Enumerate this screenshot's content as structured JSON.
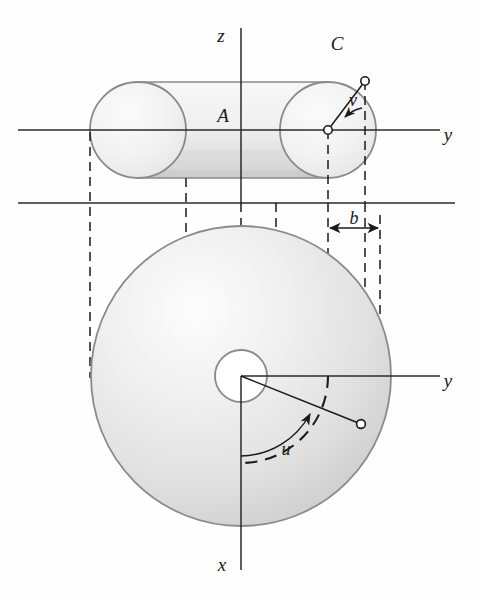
{
  "figure": {
    "background_color": "#fefefe",
    "ink_color": "#1a1a1a",
    "outline_color": "#8a8a8a",
    "shade_light": "#f2f2f2",
    "shade_mid": "#e2e2e2",
    "shade_dark": "#cfcfcf"
  },
  "labels": {
    "axis_z": "z",
    "axis_y_upper": "y",
    "axis_y_lower": "y",
    "axis_x": "x",
    "region_A": "A",
    "curve_C": "C",
    "angle_v": "v",
    "angle_u": "u",
    "dim_a": "a",
    "dim_b": "b"
  },
  "upper_view": {
    "name": "elevation-view",
    "axis_origin": {
      "x": 241,
      "y": 130
    },
    "left_circle": {
      "cx": 138,
      "cy": 130,
      "r": 48
    },
    "right_circle": {
      "cx": 328,
      "cy": 130,
      "r": 48
    },
    "tube_top_y": 82,
    "tube_bottom_y": 178,
    "tube_center_point": {
      "x": 328,
      "y": 130
    },
    "surface_point": {
      "x": 365,
      "y": 81
    },
    "angle_v_degrees": 53,
    "y_axis_end_x": 440,
    "z_axis_top_y": 28
  },
  "lower_view": {
    "name": "plan-view",
    "center": {
      "x": 241,
      "y": 376
    },
    "outer_radius": 150,
    "hole_radius": 26,
    "mid_dashed_radius": 87,
    "surface_point": {
      "x": 361,
      "y": 424
    },
    "angle_u_degrees": 22,
    "angle_arc_radius": 80,
    "y_axis_end_x": 440,
    "x_axis_bottom_y": 570
  },
  "dimensions": {
    "a": {
      "from_x": 241,
      "to_x": 328,
      "y": 311,
      "label": "a"
    },
    "b": {
      "from_x": 328,
      "to_x": 380,
      "y": 228,
      "label": "b"
    }
  },
  "separator_line": {
    "y": 203,
    "from_x": 18,
    "to_x": 455
  },
  "projection_lines_x": [
    90,
    186,
    241,
    276,
    328,
    365,
    380
  ],
  "geometry_notes": {
    "a_meaning": "distance from z-axis to tube center circle",
    "b_meaning": "radius of the tube cross-section",
    "u_meaning": "azimuthal angle in the xy-plane measured from the x-axis",
    "v_meaning": "angle around the tube cross-section"
  }
}
